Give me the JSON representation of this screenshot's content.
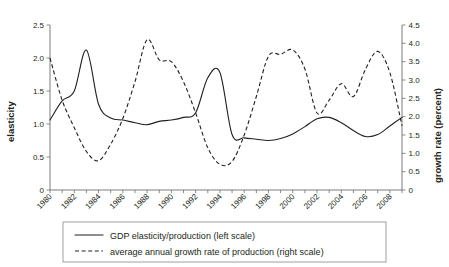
{
  "chart_data": {
    "type": "line",
    "title": "",
    "xlabel": "",
    "ylabel": "elasticity",
    "y2label": "growth rate (percent)",
    "grid": false,
    "legend_position": "bottom",
    "xlim": [
      1980,
      2009
    ],
    "ylim": [
      0,
      2.5
    ],
    "y2lim": [
      0,
      4.5
    ],
    "x_tick_labels": [
      "1980",
      "1982",
      "1984",
      "1986",
      "1988",
      "1990",
      "1992",
      "1994",
      "1996",
      "1998",
      "2000",
      "2002",
      "2004",
      "2006",
      "2008"
    ],
    "x_tick_values": [
      1980,
      1982,
      1984,
      1986,
      1988,
      1990,
      1992,
      1994,
      1996,
      1998,
      2000,
      2002,
      2004,
      2006,
      2008
    ],
    "x_minor_ticks": [
      1980,
      1981,
      1982,
      1983,
      1984,
      1985,
      1986,
      1987,
      1988,
      1989,
      1990,
      1991,
      1992,
      1993,
      1994,
      1995,
      1996,
      1997,
      1998,
      1999,
      2000,
      2001,
      2002,
      2003,
      2004,
      2005,
      2006,
      2007,
      2008,
      2009
    ],
    "y_tick_labels": [
      "0",
      "0.5",
      "1.0",
      "1.5",
      "2.0",
      "2.5"
    ],
    "y_tick_values": [
      0,
      0.5,
      1.0,
      1.5,
      2.0,
      2.5
    ],
    "y2_tick_labels": [
      "0",
      "0.5",
      "1.0",
      "1.5",
      "2.0",
      "2.5",
      "3.0",
      "3.5",
      "4.0",
      "4.5"
    ],
    "y2_tick_values": [
      0,
      0.5,
      1.0,
      1.5,
      2.0,
      2.5,
      3.0,
      3.5,
      4.0,
      4.5
    ],
    "x": [
      1980,
      1981,
      1982,
      1983,
      1984,
      1985,
      1986,
      1987,
      1988,
      1989,
      1990,
      1991,
      1992,
      1993,
      1994,
      1995,
      1996,
      1997,
      1998,
      1999,
      2000,
      2001,
      2002,
      2003,
      2004,
      2005,
      2006,
      2007,
      2008,
      2009
    ],
    "series": [
      {
        "name": "GDP elasticity/production (left scale)",
        "axis": "left",
        "style": "solid",
        "color": "#231f20",
        "values": [
          1.06,
          1.35,
          1.5,
          2.12,
          1.3,
          1.09,
          1.06,
          1.02,
          0.99,
          1.04,
          1.06,
          1.1,
          1.17,
          1.7,
          1.78,
          0.84,
          0.79,
          0.77,
          0.75,
          0.78,
          0.85,
          0.96,
          1.08,
          1.1,
          1.02,
          0.9,
          0.81,
          0.84,
          0.97,
          1.1
        ]
      },
      {
        "name": "average annual growth rate of production (right scale)",
        "axis": "right",
        "style": "dashed",
        "color": "#231f20",
        "values": [
          3.6,
          2.45,
          1.7,
          1.05,
          0.8,
          1.25,
          1.95,
          2.95,
          4.1,
          3.55,
          3.5,
          2.95,
          2.1,
          1.15,
          0.7,
          0.78,
          1.5,
          2.55,
          3.65,
          3.7,
          3.82,
          3.3,
          2.1,
          2.45,
          2.9,
          2.55,
          3.3,
          3.78,
          3.2,
          1.75
        ]
      }
    ]
  },
  "legend": {
    "entries": [
      {
        "label": "GDP elasticity/production (left scale)",
        "style": "solid"
      },
      {
        "label": "average annual growth rate of production (right scale)",
        "style": "dashed"
      }
    ]
  }
}
